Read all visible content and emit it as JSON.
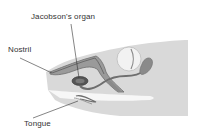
{
  "diagram": {
    "labels": [
      {
        "id": "jacobsons-organ",
        "text": "Jacobson's organ"
      },
      {
        "id": "nostril",
        "text": "Nostril"
      },
      {
        "id": "tongue",
        "text": "Tongue"
      }
    ]
  },
  "colors": {
    "head_fill": "#d9d9d9",
    "mouth_fill": "#f7f7f7",
    "structure_dark": "#6e6e6e",
    "structure_mid": "#9a9a9a",
    "eye_fill": "#f2f2f2",
    "leader_line": "#333333"
  }
}
